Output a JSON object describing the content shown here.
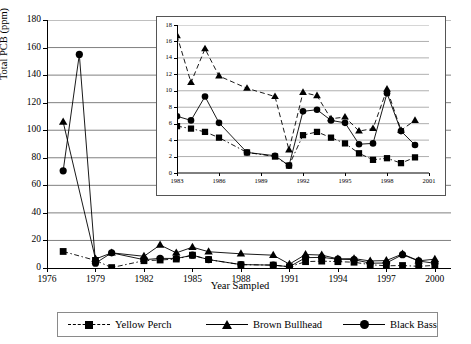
{
  "chart_data": [
    {
      "id": "main",
      "type": "line",
      "title": "",
      "xlabel": "Year Sampled",
      "ylabel": "Total PCB (ppm)",
      "xlim": [
        1976,
        2001
      ],
      "ylim": [
        0,
        180
      ],
      "ytick_step": 20,
      "yticks": [
        0,
        20,
        40,
        60,
        80,
        100,
        120,
        140,
        160,
        180
      ],
      "xticks": [
        1976,
        1979,
        1982,
        1985,
        1988,
        1991,
        1994,
        1997,
        2000
      ],
      "grid": true,
      "legend_position": "bottom",
      "series": [
        {
          "name": "Yellow Perch",
          "marker": "square",
          "line": "dash-dot",
          "x": [
            1977,
            1979,
            1980,
            1982,
            1983,
            1984,
            1985,
            1986,
            1988,
            1990,
            1991,
            1992,
            1993,
            1994,
            1995,
            1996,
            1997,
            1998,
            1999,
            2000
          ],
          "y": [
            12.0,
            5.5,
            0.3,
            5.3,
            5.8,
            6.5,
            9.3,
            6.1,
            2.4,
            2.1,
            0.9,
            4.6,
            5.0,
            4.6,
            4.2,
            2.4,
            1.6,
            1.8,
            1.2,
            1.9
          ]
        },
        {
          "name": "Brown Bullhead",
          "marker": "triangle",
          "line": "solid",
          "x": [
            1977,
            1979,
            1980,
            1982,
            1983,
            1984,
            1985,
            1986,
            1988,
            1990,
            1991,
            1992,
            1993,
            1994,
            1995,
            1996,
            1997,
            1998,
            1999,
            2000
          ],
          "y": [
            106.0,
            6.5,
            11.0,
            8.5,
            16.7,
            11.0,
            15.1,
            11.8,
            10.3,
            9.3,
            2.8,
            9.8,
            9.4,
            6.6,
            6.8,
            5.1,
            5.4,
            10.2,
            5.2,
            6.4
          ]
        },
        {
          "name": "Black Bass",
          "marker": "circle",
          "line": "solid",
          "x": [
            1977,
            1978,
            1979,
            1980,
            1982,
            1983,
            1984,
            1985,
            1986,
            1988,
            1990,
            1991,
            1992,
            1993,
            1994,
            1995,
            1996,
            1997,
            1998,
            1999,
            2000
          ],
          "y": [
            70.5,
            155.0,
            3.5,
            11.0,
            6.0,
            7.0,
            6.9,
            9.3,
            6.1,
            2.5,
            2.1,
            0.9,
            7.5,
            7.7,
            6.4,
            6.1,
            3.5,
            3.6,
            9.7,
            5.1,
            3.4
          ]
        }
      ]
    },
    {
      "id": "inset",
      "type": "line",
      "title": "",
      "xlabel": "",
      "ylabel": "",
      "xlim": [
        1983,
        2001
      ],
      "ylim": [
        0,
        18
      ],
      "ytick_step": 2,
      "yticks": [
        0,
        2,
        4,
        6,
        8,
        10,
        12,
        14,
        16,
        18
      ],
      "xticks": [
        1983,
        1986,
        1989,
        1992,
        1995,
        1998,
        2001
      ],
      "grid": true,
      "series": [
        {
          "name": "Yellow Perch",
          "marker": "square",
          "line": "dash-dot",
          "x": [
            1983,
            1984,
            1985,
            1986,
            1988,
            1990,
            1991,
            1992,
            1993,
            1994,
            1995,
            1996,
            1997,
            1998,
            1999,
            2000
          ],
          "y": [
            5.7,
            5.4,
            5.0,
            4.3,
            2.5,
            2.0,
            0.9,
            4.6,
            5.0,
            4.3,
            3.6,
            2.4,
            1.6,
            1.8,
            1.2,
            1.9
          ]
        },
        {
          "name": "Brown Bullhead",
          "marker": "triangle",
          "line": "dashed",
          "x": [
            1983,
            1984,
            1985,
            1986,
            1988,
            1990,
            1991,
            1992,
            1993,
            1994,
            1995,
            1996,
            1997,
            1998,
            1999,
            2000
          ],
          "y": [
            16.7,
            11.0,
            15.1,
            11.8,
            10.3,
            9.3,
            2.8,
            9.8,
            9.4,
            6.6,
            6.8,
            5.1,
            5.4,
            10.2,
            5.2,
            6.4
          ]
        },
        {
          "name": "Black Bass",
          "marker": "circle",
          "line": "solid",
          "x": [
            1983,
            1984,
            1985,
            1986,
            1988,
            1990,
            1991,
            1992,
            1993,
            1994,
            1995,
            1996,
            1997,
            1998,
            1999,
            2000
          ],
          "y": [
            6.9,
            6.4,
            9.3,
            6.1,
            2.5,
            2.1,
            0.9,
            7.5,
            7.7,
            6.4,
            6.1,
            3.5,
            3.6,
            9.7,
            5.1,
            3.4
          ]
        }
      ]
    }
  ],
  "legend": {
    "items": [
      {
        "label": "Yellow Perch",
        "marker": "square",
        "line": "dash-dot"
      },
      {
        "label": "Brown Bullhead",
        "marker": "triangle",
        "line": "solid"
      },
      {
        "label": "Black Bass",
        "marker": "circle",
        "line": "solid"
      }
    ]
  },
  "colors": {
    "series": "#000000",
    "grid": "#808080",
    "axis": "#000000",
    "background": "#ffffff"
  }
}
